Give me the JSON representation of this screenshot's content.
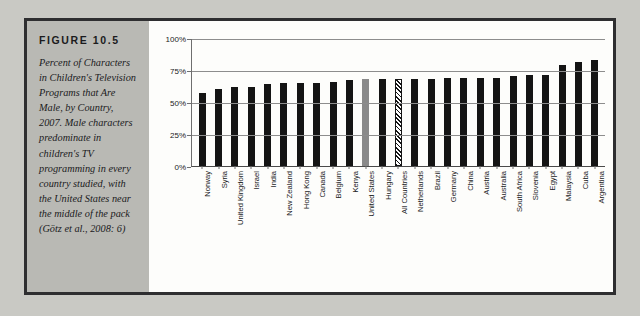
{
  "figure": {
    "label": "FIGURE 10.5",
    "caption": "Percent of Characters in Children's Television Programs that Are Male, by Country, 2007. Male characters predominate in children's TV programming in every country studied, with the United States near the middle of the pack (Götz et al., 2008: 6)"
  },
  "colors": {
    "bar_default": "#141414",
    "bar_highlight": "#8a8a8a",
    "bar_pattern": "#141414",
    "panel_background": "#b9b9b4",
    "figure_background": "#fdfdfb",
    "border": "#2e2e30",
    "gridline": "#8d8d8d"
  },
  "chart_data": {
    "type": "bar",
    "title": "Percent of Characters in Children's Television Programs that Are Male, by Country, 2007",
    "xlabel": "",
    "ylabel": "",
    "ylim": [
      0,
      100
    ],
    "ytick_labels": [
      "100%",
      "75%",
      "50%",
      "25%",
      "0%"
    ],
    "ytick_values": [
      100,
      75,
      50,
      25,
      0
    ],
    "grid": true,
    "legend": "none",
    "categories": [
      "Norway",
      "Syria",
      "United Kingdom",
      "Israel",
      "India",
      "New Zealand",
      "Hong Kong",
      "Canada",
      "Belgium",
      "Kenya",
      "United States",
      "Hungary",
      "All Countries",
      "Netherlands",
      "Brazil",
      "Germany",
      "China",
      "Austria",
      "Australia",
      "South Africa",
      "Slovenia",
      "Egypt",
      "Malaysia",
      "Cuba",
      "Argentina"
    ],
    "values": [
      57,
      60,
      62,
      62,
      64,
      65,
      65,
      65,
      66,
      67,
      68,
      68,
      68,
      68,
      68,
      69,
      69,
      69,
      69,
      70,
      71,
      71,
      79,
      81,
      83
    ],
    "styles": [
      "solid",
      "solid",
      "solid",
      "solid",
      "solid",
      "solid",
      "solid",
      "solid",
      "solid",
      "solid",
      "highlight",
      "solid",
      "hatch",
      "solid",
      "solid",
      "solid",
      "solid",
      "solid",
      "solid",
      "solid",
      "solid",
      "solid",
      "solid",
      "solid",
      "solid"
    ]
  }
}
